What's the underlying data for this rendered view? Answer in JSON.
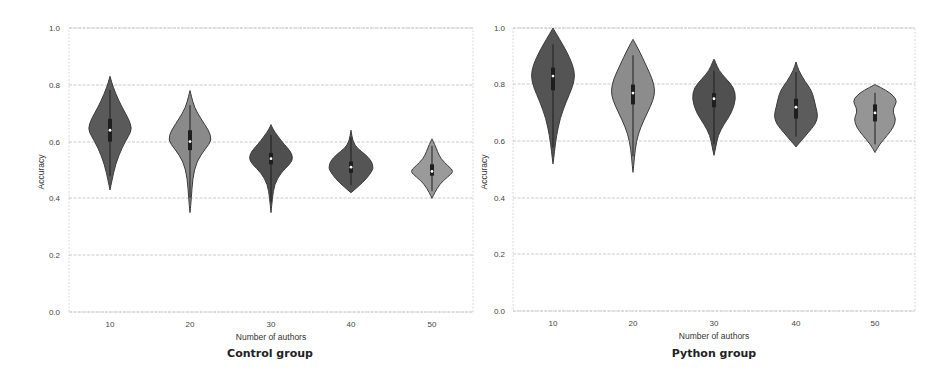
{
  "chart_data": [
    {
      "type": "violin",
      "title": "Control group",
      "xlabel": "Number of authors",
      "ylabel": "Accuracy",
      "ylim": [
        0.0,
        1.0
      ],
      "yticks": [
        "0.0",
        "0.2",
        "0.4",
        "0.6",
        "0.8",
        "1.0"
      ],
      "grid": true,
      "categories": [
        "10",
        "20",
        "30",
        "40",
        "50"
      ],
      "series": [
        {
          "category": "10",
          "min": 0.43,
          "max": 0.83,
          "median": 0.64,
          "q1": 0.6,
          "q3": 0.68,
          "widest_at": 0.64,
          "color": "#5a5a5a",
          "profile": [
            [
              0.43,
              0.0
            ],
            [
              0.46,
              0.08
            ],
            [
              0.52,
              0.25
            ],
            [
              0.58,
              0.55
            ],
            [
              0.62,
              0.85
            ],
            [
              0.645,
              1.0
            ],
            [
              0.68,
              0.85
            ],
            [
              0.72,
              0.55
            ],
            [
              0.77,
              0.25
            ],
            [
              0.81,
              0.07
            ],
            [
              0.83,
              0.0
            ]
          ]
        },
        {
          "category": "20",
          "min": 0.35,
          "max": 0.78,
          "median": 0.6,
          "q1": 0.57,
          "q3": 0.64,
          "widest_at": 0.61,
          "color": "#8a8a8a",
          "profile": [
            [
              0.35,
              0.0
            ],
            [
              0.4,
              0.06
            ],
            [
              0.47,
              0.12
            ],
            [
              0.53,
              0.3
            ],
            [
              0.575,
              0.7
            ],
            [
              0.605,
              1.0
            ],
            [
              0.64,
              0.85
            ],
            [
              0.68,
              0.5
            ],
            [
              0.72,
              0.2
            ],
            [
              0.76,
              0.06
            ],
            [
              0.78,
              0.0
            ]
          ]
        },
        {
          "category": "30",
          "min": 0.35,
          "max": 0.66,
          "median": 0.54,
          "q1": 0.52,
          "q3": 0.56,
          "widest_at": 0.54,
          "color": "#4f4f4f",
          "profile": [
            [
              0.35,
              0.0
            ],
            [
              0.4,
              0.06
            ],
            [
              0.45,
              0.16
            ],
            [
              0.49,
              0.45
            ],
            [
              0.52,
              0.85
            ],
            [
              0.54,
              1.0
            ],
            [
              0.565,
              0.9
            ],
            [
              0.59,
              0.6
            ],
            [
              0.62,
              0.3
            ],
            [
              0.645,
              0.08
            ],
            [
              0.66,
              0.0
            ]
          ]
        },
        {
          "category": "40",
          "min": 0.42,
          "max": 0.64,
          "median": 0.51,
          "q1": 0.49,
          "q3": 0.53,
          "widest_at": 0.51,
          "color": "#555555",
          "profile": [
            [
              0.42,
              0.0
            ],
            [
              0.44,
              0.3
            ],
            [
              0.47,
              0.72
            ],
            [
              0.5,
              0.98
            ],
            [
              0.51,
              1.0
            ],
            [
              0.53,
              0.95
            ],
            [
              0.555,
              0.65
            ],
            [
              0.575,
              0.3
            ],
            [
              0.6,
              0.08
            ],
            [
              0.64,
              0.0
            ]
          ]
        },
        {
          "category": "50",
          "min": 0.4,
          "max": 0.61,
          "median": 0.495,
          "q1": 0.48,
          "q3": 0.52,
          "widest_at": 0.495,
          "color": "#9a9a9a",
          "profile": [
            [
              0.4,
              0.0
            ],
            [
              0.42,
              0.12
            ],
            [
              0.45,
              0.35
            ],
            [
              0.475,
              0.7
            ],
            [
              0.495,
              1.0
            ],
            [
              0.515,
              0.72
            ],
            [
              0.54,
              0.4
            ],
            [
              0.565,
              0.25
            ],
            [
              0.59,
              0.12
            ],
            [
              0.61,
              0.0
            ]
          ]
        }
      ]
    },
    {
      "type": "violin",
      "title": "Python group",
      "xlabel": "Number of authors",
      "ylabel": "Accuracy",
      "ylim": [
        0.0,
        1.0
      ],
      "yticks": [
        "0.0",
        "0.2",
        "0.4",
        "0.6",
        "0.8",
        "1.0"
      ],
      "grid": true,
      "categories": [
        "10",
        "20",
        "30",
        "40",
        "50"
      ],
      "series": [
        {
          "category": "10",
          "min": 0.52,
          "max": 1.0,
          "median": 0.83,
          "q1": 0.78,
          "q3": 0.86,
          "widest_at": 0.83,
          "color": "#545454",
          "profile": [
            [
              0.52,
              0.0
            ],
            [
              0.56,
              0.06
            ],
            [
              0.62,
              0.16
            ],
            [
              0.68,
              0.32
            ],
            [
              0.74,
              0.6
            ],
            [
              0.79,
              0.88
            ],
            [
              0.83,
              1.0
            ],
            [
              0.87,
              0.9
            ],
            [
              0.92,
              0.6
            ],
            [
              0.96,
              0.3
            ],
            [
              1.0,
              0.0
            ]
          ]
        },
        {
          "category": "20",
          "min": 0.49,
          "max": 0.96,
          "median": 0.77,
          "q1": 0.73,
          "q3": 0.8,
          "widest_at": 0.78,
          "color": "#8c8c8c",
          "profile": [
            [
              0.49,
              0.0
            ],
            [
              0.54,
              0.06
            ],
            [
              0.6,
              0.15
            ],
            [
              0.65,
              0.35
            ],
            [
              0.7,
              0.65
            ],
            [
              0.745,
              0.92
            ],
            [
              0.78,
              1.0
            ],
            [
              0.82,
              0.88
            ],
            [
              0.87,
              0.58
            ],
            [
              0.92,
              0.28
            ],
            [
              0.96,
              0.0
            ]
          ]
        },
        {
          "category": "30",
          "min": 0.55,
          "max": 0.89,
          "median": 0.75,
          "q1": 0.72,
          "q3": 0.77,
          "widest_at": 0.75,
          "color": "#505050",
          "profile": [
            [
              0.55,
              0.0
            ],
            [
              0.58,
              0.08
            ],
            [
              0.62,
              0.18
            ],
            [
              0.66,
              0.45
            ],
            [
              0.7,
              0.8
            ],
            [
              0.75,
              1.0
            ],
            [
              0.79,
              0.9
            ],
            [
              0.82,
              0.55
            ],
            [
              0.85,
              0.22
            ],
            [
              0.88,
              0.06
            ],
            [
              0.89,
              0.0
            ]
          ]
        },
        {
          "category": "40",
          "min": 0.58,
          "max": 0.88,
          "median": 0.72,
          "q1": 0.68,
          "q3": 0.75,
          "widest_at": 0.69,
          "color": "#5c5c5c",
          "profile": [
            [
              0.58,
              0.0
            ],
            [
              0.6,
              0.22
            ],
            [
              0.63,
              0.55
            ],
            [
              0.66,
              0.88
            ],
            [
              0.69,
              1.0
            ],
            [
              0.72,
              0.9
            ],
            [
              0.75,
              0.82
            ],
            [
              0.78,
              0.7
            ],
            [
              0.81,
              0.42
            ],
            [
              0.85,
              0.12
            ],
            [
              0.88,
              0.0
            ]
          ]
        },
        {
          "category": "50",
          "min": 0.56,
          "max": 0.8,
          "median": 0.7,
          "q1": 0.67,
          "q3": 0.73,
          "widest_at": 0.74,
          "color": "#959595",
          "profile": [
            [
              0.56,
              0.0
            ],
            [
              0.59,
              0.22
            ],
            [
              0.62,
              0.55
            ],
            [
              0.65,
              0.85
            ],
            [
              0.68,
              0.95
            ],
            [
              0.7,
              0.82
            ],
            [
              0.72,
              0.85
            ],
            [
              0.74,
              1.0
            ],
            [
              0.76,
              0.85
            ],
            [
              0.78,
              0.5
            ],
            [
              0.8,
              0.0
            ]
          ]
        }
      ]
    }
  ],
  "panels": {
    "left": {
      "title": "Control group",
      "xlabel": "Number of authors",
      "ylabel": "Accuracy",
      "xticks": [
        "10",
        "20",
        "30",
        "40",
        "50"
      ],
      "yticks": [
        "0.0",
        "0.2",
        "0.4",
        "0.6",
        "0.8",
        "1.0"
      ]
    },
    "right": {
      "title": "Python group",
      "xlabel": "Number of authors",
      "ylabel": "Accuracy",
      "xticks": [
        "10",
        "20",
        "30",
        "40",
        "50"
      ],
      "yticks": [
        "0.0",
        "0.2",
        "0.4",
        "0.6",
        "0.8",
        "1.0"
      ]
    }
  }
}
